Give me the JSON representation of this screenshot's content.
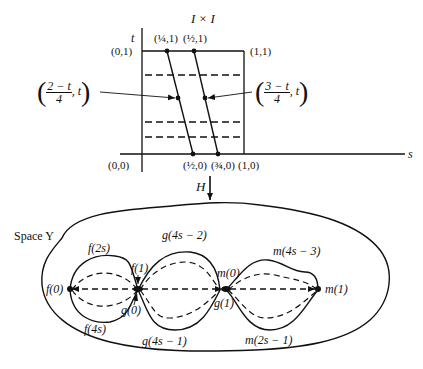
{
  "top_diagram": {
    "title": "I × I",
    "axis_t": "t",
    "axis_s": "s",
    "corners": {
      "origin": "(0,0)",
      "top_left": "(0,1)",
      "top_right": "(1,1)",
      "bottom_right": "(1,0)"
    },
    "top_points": [
      "(¼,1)",
      "(½,1)"
    ],
    "bottom_points": [
      "(½,0)",
      "(¾,0)"
    ],
    "left_callout": {
      "numerator": "2 − t",
      "denominator": "4",
      "tail": ", t"
    },
    "right_callout": {
      "numerator": "3 − t",
      "denominator": "4",
      "tail": ", t"
    }
  },
  "map_label": "H",
  "bottom_diagram": {
    "space_label": "Space Y",
    "labels": {
      "f0": "f(0)",
      "f2s": "f(2s)",
      "f4s": "f(4s)",
      "f1": "f(1)",
      "g0": "g(0)",
      "g4s2": "g(4s − 2)",
      "g4s1": "g(4s − 1)",
      "g1": "g(1)",
      "m0": "m(0)",
      "m4s3": "m(4s − 3)",
      "m2s1": "m(2s − 1)",
      "m1": "m(1)"
    }
  }
}
